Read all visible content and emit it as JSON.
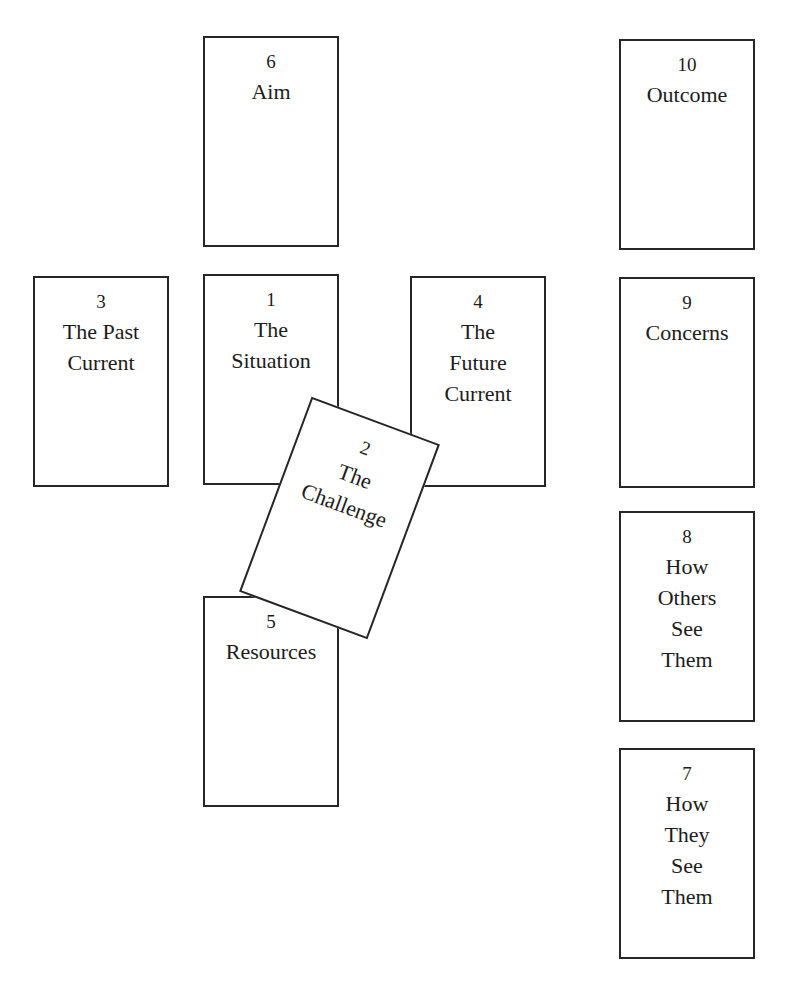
{
  "diagram": {
    "cards": [
      {
        "position": 1,
        "number": "1",
        "label": "The\nSituation"
      },
      {
        "position": 2,
        "number": "2",
        "label": "The\nChallenge",
        "rotation_deg": 20
      },
      {
        "position": 3,
        "number": "3",
        "label": "The Past\nCurrent"
      },
      {
        "position": 4,
        "number": "4",
        "label": "The\nFuture\nCurrent"
      },
      {
        "position": 5,
        "number": "5",
        "label": "Resources"
      },
      {
        "position": 6,
        "number": "6",
        "label": "Aim"
      },
      {
        "position": 7,
        "number": "7",
        "label": "How\nThey\nSee\nThem"
      },
      {
        "position": 8,
        "number": "8",
        "label": "How\nOthers\nSee\nThem"
      },
      {
        "position": 9,
        "number": "9",
        "label": "Concerns"
      },
      {
        "position": 10,
        "number": "10",
        "label": "Outcome"
      }
    ]
  },
  "colors": {
    "background": "#ffffff",
    "border": "#262626",
    "text": "#1c1c1c"
  }
}
